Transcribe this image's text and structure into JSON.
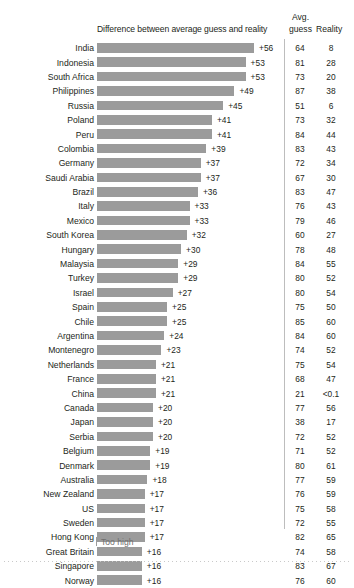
{
  "header": {
    "diff_label": "Difference between average guess and reality",
    "avg_label": "Avg.",
    "guess_label": "guess",
    "reality_label": "Reality"
  },
  "legend": {
    "too_high": "Too high"
  },
  "chart_data": {
    "type": "bar",
    "title": "",
    "xlabel": "Difference between average guess and reality",
    "ylabel": "",
    "grid": false,
    "legend_position": "bottom-left",
    "orientation": "horizontal",
    "bar_color": "#9b9b9b",
    "xlim": [
      0,
      56
    ],
    "columns": [
      "Country",
      "Difference",
      "Avg. guess",
      "Reality"
    ],
    "categories": [
      "India",
      "Indonesia",
      "South Africa",
      "Philippines",
      "Russia",
      "Poland",
      "Peru",
      "Colombia",
      "Germany",
      "Saudi Arabia",
      "Brazil",
      "Italy",
      "Mexico",
      "South Korea",
      "Hungary",
      "Malaysia",
      "Turkey",
      "Israel",
      "Spain",
      "Chile",
      "Argentina",
      "Montenegro",
      "Netherlands",
      "France",
      "China",
      "Canada",
      "Japan",
      "Serbia",
      "Belgium",
      "Denmark",
      "Australia",
      "New Zealand",
      "US",
      "Sweden",
      "Hong Kong",
      "Great Britain",
      "Singapore",
      "Norway"
    ],
    "values": [
      56,
      53,
      53,
      49,
      45,
      41,
      41,
      39,
      37,
      37,
      36,
      33,
      33,
      32,
      30,
      29,
      29,
      27,
      25,
      25,
      24,
      23,
      21,
      21,
      21,
      20,
      20,
      20,
      19,
      19,
      18,
      17,
      17,
      17,
      17,
      16,
      16,
      16
    ],
    "value_labels": [
      "+56",
      "+53",
      "+53",
      "+49",
      "+45",
      "+41",
      "+41",
      "+39",
      "+37",
      "+37",
      "+36",
      "+33",
      "+33",
      "+32",
      "+30",
      "+29",
      "+29",
      "+27",
      "+25",
      "+25",
      "+24",
      "+23",
      "+21",
      "+21",
      "+21",
      "+20",
      "+20",
      "+20",
      "+19",
      "+19",
      "+18",
      "+17",
      "+17",
      "+17",
      "+17",
      "+16",
      "+16",
      "+16"
    ],
    "series": [
      {
        "name": "Avg. guess",
        "values": [
          64,
          81,
          73,
          87,
          51,
          73,
          84,
          83,
          72,
          67,
          83,
          76,
          79,
          60,
          78,
          84,
          80,
          80,
          75,
          85,
          84,
          74,
          75,
          68,
          21,
          77,
          38,
          72,
          71,
          80,
          77,
          76,
          75,
          72,
          82,
          74,
          83,
          76
        ]
      },
      {
        "name": "Reality",
        "values": [
          8,
          28,
          20,
          38,
          6,
          32,
          44,
          43,
          34,
          30,
          47,
          43,
          46,
          27,
          48,
          55,
          52,
          54,
          50,
          60,
          60,
          52,
          54,
          47,
          "<0.1",
          56,
          17,
          52,
          52,
          61,
          59,
          59,
          58,
          55,
          65,
          58,
          67,
          60
        ]
      }
    ],
    "rows": [
      {
        "country": "India",
        "diff": "+56",
        "bar": 56,
        "guess": "64",
        "reality": "8"
      },
      {
        "country": "Indonesia",
        "diff": "+53",
        "bar": 53,
        "guess": "81",
        "reality": "28"
      },
      {
        "country": "South Africa",
        "diff": "+53",
        "bar": 53,
        "guess": "73",
        "reality": "20"
      },
      {
        "country": "Philippines",
        "diff": "+49",
        "bar": 49,
        "guess": "87",
        "reality": "38"
      },
      {
        "country": "Russia",
        "diff": "+45",
        "bar": 45,
        "guess": "51",
        "reality": "6"
      },
      {
        "country": "Poland",
        "diff": "+41",
        "bar": 41,
        "guess": "73",
        "reality": "32"
      },
      {
        "country": "Peru",
        "diff": "+41",
        "bar": 41,
        "guess": "84",
        "reality": "44"
      },
      {
        "country": "Colombia",
        "diff": "+39",
        "bar": 39,
        "guess": "83",
        "reality": "43"
      },
      {
        "country": "Germany",
        "diff": "+37",
        "bar": 37,
        "guess": "72",
        "reality": "34"
      },
      {
        "country": "Saudi Arabia",
        "diff": "+37",
        "bar": 37,
        "guess": "67",
        "reality": "30"
      },
      {
        "country": "Brazil",
        "diff": "+36",
        "bar": 36,
        "guess": "83",
        "reality": "47"
      },
      {
        "country": "Italy",
        "diff": "+33",
        "bar": 33,
        "guess": "76",
        "reality": "43"
      },
      {
        "country": "Mexico",
        "diff": "+33",
        "bar": 33,
        "guess": "79",
        "reality": "46"
      },
      {
        "country": "South Korea",
        "diff": "+32",
        "bar": 32,
        "guess": "60",
        "reality": "27"
      },
      {
        "country": "Hungary",
        "diff": "+30",
        "bar": 30,
        "guess": "78",
        "reality": "48"
      },
      {
        "country": "Malaysia",
        "diff": "+29",
        "bar": 29,
        "guess": "84",
        "reality": "55"
      },
      {
        "country": "Turkey",
        "diff": "+29",
        "bar": 29,
        "guess": "80",
        "reality": "52"
      },
      {
        "country": "Israel",
        "diff": "+27",
        "bar": 27,
        "guess": "80",
        "reality": "54"
      },
      {
        "country": "Spain",
        "diff": "+25",
        "bar": 25,
        "guess": "75",
        "reality": "50"
      },
      {
        "country": "Chile",
        "diff": "+25",
        "bar": 25,
        "guess": "85",
        "reality": "60"
      },
      {
        "country": "Argentina",
        "diff": "+24",
        "bar": 24,
        "guess": "84",
        "reality": "60"
      },
      {
        "country": "Montenegro",
        "diff": "+23",
        "bar": 23,
        "guess": "74",
        "reality": "52"
      },
      {
        "country": "Netherlands",
        "diff": "+21",
        "bar": 21,
        "guess": "75",
        "reality": "54"
      },
      {
        "country": "France",
        "diff": "+21",
        "bar": 21,
        "guess": "68",
        "reality": "47"
      },
      {
        "country": "China",
        "diff": "+21",
        "bar": 21,
        "guess": "21",
        "reality": "<0.1"
      },
      {
        "country": "Canada",
        "diff": "+20",
        "bar": 20,
        "guess": "77",
        "reality": "56"
      },
      {
        "country": "Japan",
        "diff": "+20",
        "bar": 20,
        "guess": "38",
        "reality": "17"
      },
      {
        "country": "Serbia",
        "diff": "+20",
        "bar": 20,
        "guess": "72",
        "reality": "52"
      },
      {
        "country": "Belgium",
        "diff": "+19",
        "bar": 19,
        "guess": "71",
        "reality": "52"
      },
      {
        "country": "Denmark",
        "diff": "+19",
        "bar": 19,
        "guess": "80",
        "reality": "61"
      },
      {
        "country": "Australia",
        "diff": "+18",
        "bar": 18,
        "guess": "77",
        "reality": "59"
      },
      {
        "country": "New Zealand",
        "diff": "+17",
        "bar": 17,
        "guess": "76",
        "reality": "59"
      },
      {
        "country": "US",
        "diff": "+17",
        "bar": 17,
        "guess": "75",
        "reality": "58"
      },
      {
        "country": "Sweden",
        "diff": "+17",
        "bar": 17,
        "guess": "72",
        "reality": "55"
      },
      {
        "country": "Hong Kong",
        "diff": "+17",
        "bar": 17,
        "guess": "82",
        "reality": "65"
      },
      {
        "country": "Great Britain",
        "diff": "+16",
        "bar": 16,
        "guess": "74",
        "reality": "58"
      },
      {
        "country": "Singapore",
        "diff": "+16",
        "bar": 16,
        "guess": "83",
        "reality": "67"
      },
      {
        "country": "Norway",
        "diff": "+16",
        "bar": 16,
        "guess": "76",
        "reality": "60"
      }
    ]
  }
}
